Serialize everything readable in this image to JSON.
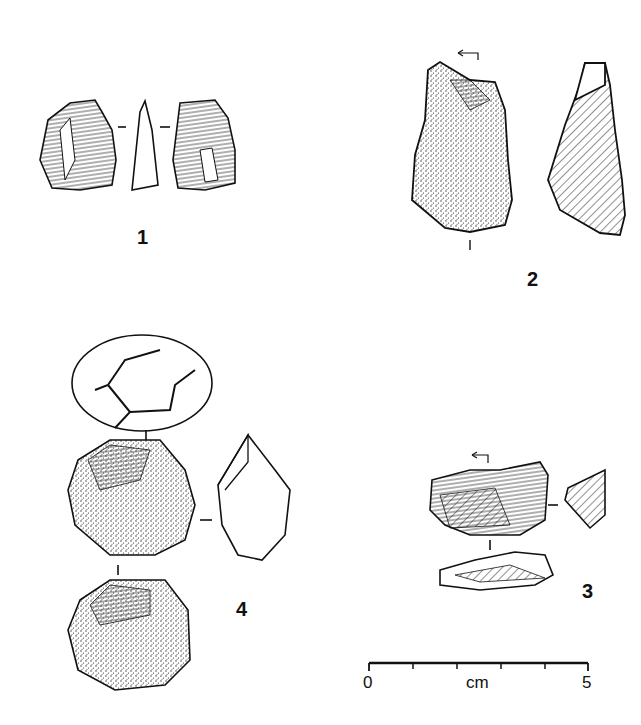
{
  "plate": {
    "artifacts": [
      {
        "id": "1",
        "label": "1",
        "views": [
          "dorsal",
          "profile",
          "ventral"
        ]
      },
      {
        "id": "2",
        "label": "2",
        "views": [
          "dorsal",
          "section"
        ]
      },
      {
        "id": "3",
        "label": "3",
        "views": [
          "dorsal",
          "section",
          "platform"
        ]
      },
      {
        "id": "4",
        "label": "4",
        "views": [
          "platform",
          "face-a",
          "profile",
          "face-b"
        ]
      }
    ],
    "scale_bar": {
      "start_label": "0",
      "unit_label": "cm",
      "end_label": "5",
      "ticks": 6
    }
  },
  "colors": {
    "ink": "#111111",
    "background": "#ffffff"
  }
}
